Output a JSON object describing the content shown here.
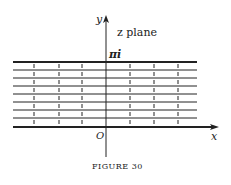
{
  "diagram": {
    "plane_label": "z plane",
    "y_axis_label": "y",
    "x_axis_label": "x",
    "origin_label": "O",
    "top_boundary_label": "πi",
    "caption": "FIGURE 30",
    "horizontal_lines": 9,
    "vertical_dashed_lines": 6,
    "line_color": "#222222"
  }
}
